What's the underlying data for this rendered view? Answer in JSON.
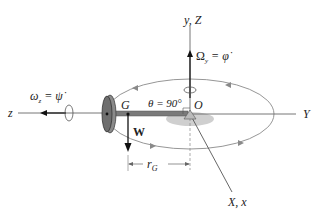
{
  "diagram": {
    "colors": {
      "axis": "#555555",
      "orbit": "#8a8a8a",
      "rod": "#7a7a7a",
      "disk": "#777777",
      "shadow": "#cfcfcf",
      "arrow": "#111111"
    },
    "labels": {
      "y_axis": "y, Z",
      "Y_axis": "Y",
      "z_axis": "z",
      "X_axis": "X, x",
      "origin": "O",
      "center_of_gravity": "G",
      "weight": "W",
      "theta": "θ = 90°",
      "radius_main": "r",
      "radius_sub": "G",
      "precession_main": "Ω",
      "precession_sub": "y",
      "precession_rhs": " = φ̇",
      "spin_main": "ω",
      "spin_sub": "z",
      "spin_rhs": " = ψ̇"
    }
  }
}
